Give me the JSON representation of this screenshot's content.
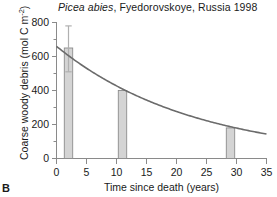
{
  "panel": {
    "label": "B"
  },
  "title": {
    "species": "Picea abies",
    "rest": ", Fyedorovskoye, Russia 1998",
    "full": "Picea abies, Fyedorovskoye, Russia 1998"
  },
  "axes": {
    "y_label_main": "Coarse woody debris (mol C m",
    "y_label_exponent": "-2",
    "y_label_close": ")",
    "y_label_full": "Coarse woody debris (mol C m-2)",
    "x_label": "Time since death (years)",
    "y_ticks": [
      "0",
      "200",
      "400",
      "600",
      "800"
    ],
    "x_ticks": [
      "0",
      "5",
      "10",
      "15",
      "20",
      "25",
      "30",
      "35"
    ]
  },
  "chart_data": {
    "type": "bar",
    "title": "Picea abies, Fyedorovskoye, Russia 1998",
    "xlabel": "Time since death (years)",
    "ylabel": "Coarse woody debris (mol C m-2)",
    "xlim": [
      0,
      35
    ],
    "ylim": [
      0,
      800
    ],
    "xticks": [
      0,
      5,
      10,
      15,
      20,
      25,
      30,
      35
    ],
    "yticks": [
      0,
      200,
      400,
      600,
      800
    ],
    "yminorticks": [
      100,
      300,
      500,
      700
    ],
    "grid": false,
    "legend": false,
    "bar_color": "#d4d4d4",
    "bar_edge_color": "#8c8c8c",
    "curve_color": "#6b6b6b",
    "errorbar_color": "#b0b0b0",
    "bars": [
      {
        "x": 2.0,
        "value": 650,
        "error_upper": 780,
        "error_lower": 510,
        "width": 1.4
      },
      {
        "x": 11.0,
        "value": 400,
        "width": 1.4
      },
      {
        "x": 29.0,
        "value": 180,
        "width": 1.4
      }
    ],
    "categories": [
      2,
      11,
      29
    ],
    "values": [
      650,
      400,
      180
    ],
    "series": [
      {
        "name": "Coarse woody debris (observed)",
        "type": "bar",
        "x": [
          2,
          11,
          29
        ],
        "values": [
          650,
          400,
          180
        ]
      },
      {
        "name": "Exponential decay fit",
        "type": "line",
        "equation": "y = 660 * exp(-0.0435 * t)",
        "y0": 660,
        "k": 0.0435,
        "x": [
          0,
          5,
          10,
          15,
          20,
          25,
          30,
          35
        ],
        "values": [
          660,
          531,
          427,
          344,
          277,
          222,
          179,
          144
        ]
      }
    ],
    "annotations": [
      {
        "text": "error bar on first bar",
        "x": 2,
        "y_top": 780,
        "y_bottom": 510
      }
    ]
  }
}
